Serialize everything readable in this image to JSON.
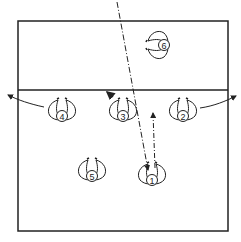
{
  "diagram": {
    "title": "",
    "colors": {
      "ink": "#222222",
      "background": "#ffffff"
    },
    "court": {
      "x": 18,
      "y": 21,
      "width": 210,
      "height": 210
    },
    "net": {
      "y": 90
    },
    "players": [
      {
        "number": "6",
        "x": 158,
        "y": 45,
        "facing": "left"
      },
      {
        "number": "4",
        "x": 62,
        "y": 110,
        "facing": "up"
      },
      {
        "number": "3",
        "x": 123,
        "y": 110,
        "facing": "up"
      },
      {
        "number": "2",
        "x": 183,
        "y": 110,
        "facing": "up"
      },
      {
        "number": "5",
        "x": 92,
        "y": 170,
        "facing": "up"
      },
      {
        "number": "1",
        "x": 152,
        "y": 174,
        "facing": "up"
      }
    ],
    "paths": [
      {
        "type": "dash-dot",
        "from": [
          117,
          2
        ],
        "to": [
          148,
          170
        ],
        "label": "ball trajectory"
      },
      {
        "type": "dashed-arrow",
        "from": [
          155,
          168
        ],
        "to": [
          153,
          112
        ],
        "label": "player 1 movement"
      },
      {
        "type": "arrow",
        "from": [
          44,
          107
        ],
        "to": [
          8,
          95
        ],
        "label": "player 4 movement"
      },
      {
        "type": "arrow",
        "from": [
          200,
          108
        ],
        "to": [
          236,
          96
        ],
        "label": "player 2 movement"
      },
      {
        "type": "arrow",
        "from": [
          116,
          100
        ],
        "to": [
          107,
          92
        ],
        "label": "player 3 turn"
      }
    ]
  }
}
